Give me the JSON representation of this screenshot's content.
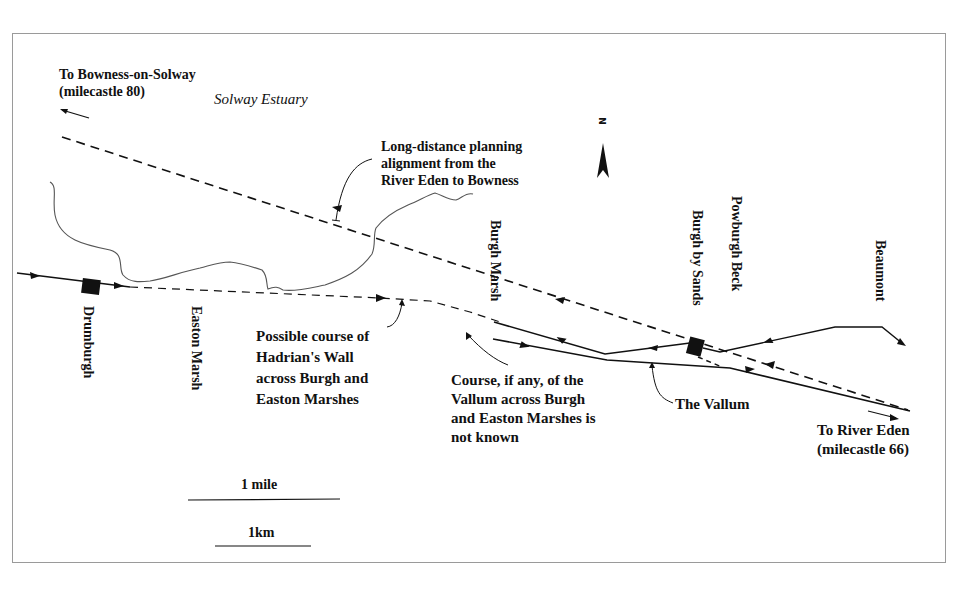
{
  "map": {
    "labels": {
      "bowness_line1": "To Bowness-on-Solway",
      "bowness_line2": "(milecastle 80)",
      "solway_estuary": "Solway Estuary",
      "planning_line1": "Long-distance planning",
      "planning_line2": "alignment from the",
      "planning_line3": "River Eden to Bowness",
      "burgh_marsh_line1": "Burgh",
      "burgh_marsh_line2": "Marsh",
      "burgh_by_sands": "Burgh by Sands",
      "powburgh_beck": "Powburgh Beck",
      "beaumont": "Beaumont",
      "drumburgh": "Drumburgh",
      "easton_marsh_line1": "Easton",
      "easton_marsh_line2": "Marsh",
      "wall_line1": "Possible course of",
      "wall_line2": "Hadrian's Wall",
      "wall_line3": "across Burgh and",
      "wall_line4": "Easton Marshes",
      "vallum_course_line1": "Course, if any, of the",
      "vallum_course_line2": "Vallum across Burgh",
      "vallum_course_line3": "and Easton Marshes is",
      "vallum_course_line4": "not known",
      "the_vallum": "The Vallum",
      "eden_line1": "To River Eden",
      "eden_line2": "(milecastle 66)"
    },
    "north_arrow": {
      "letter": "N"
    },
    "scale": {
      "mile_label": "1 mile",
      "km_label": "1km"
    },
    "colors": {
      "line": "#111111",
      "coast": "#555555",
      "border": "#9a9a9a",
      "background": "#ffffff"
    }
  }
}
